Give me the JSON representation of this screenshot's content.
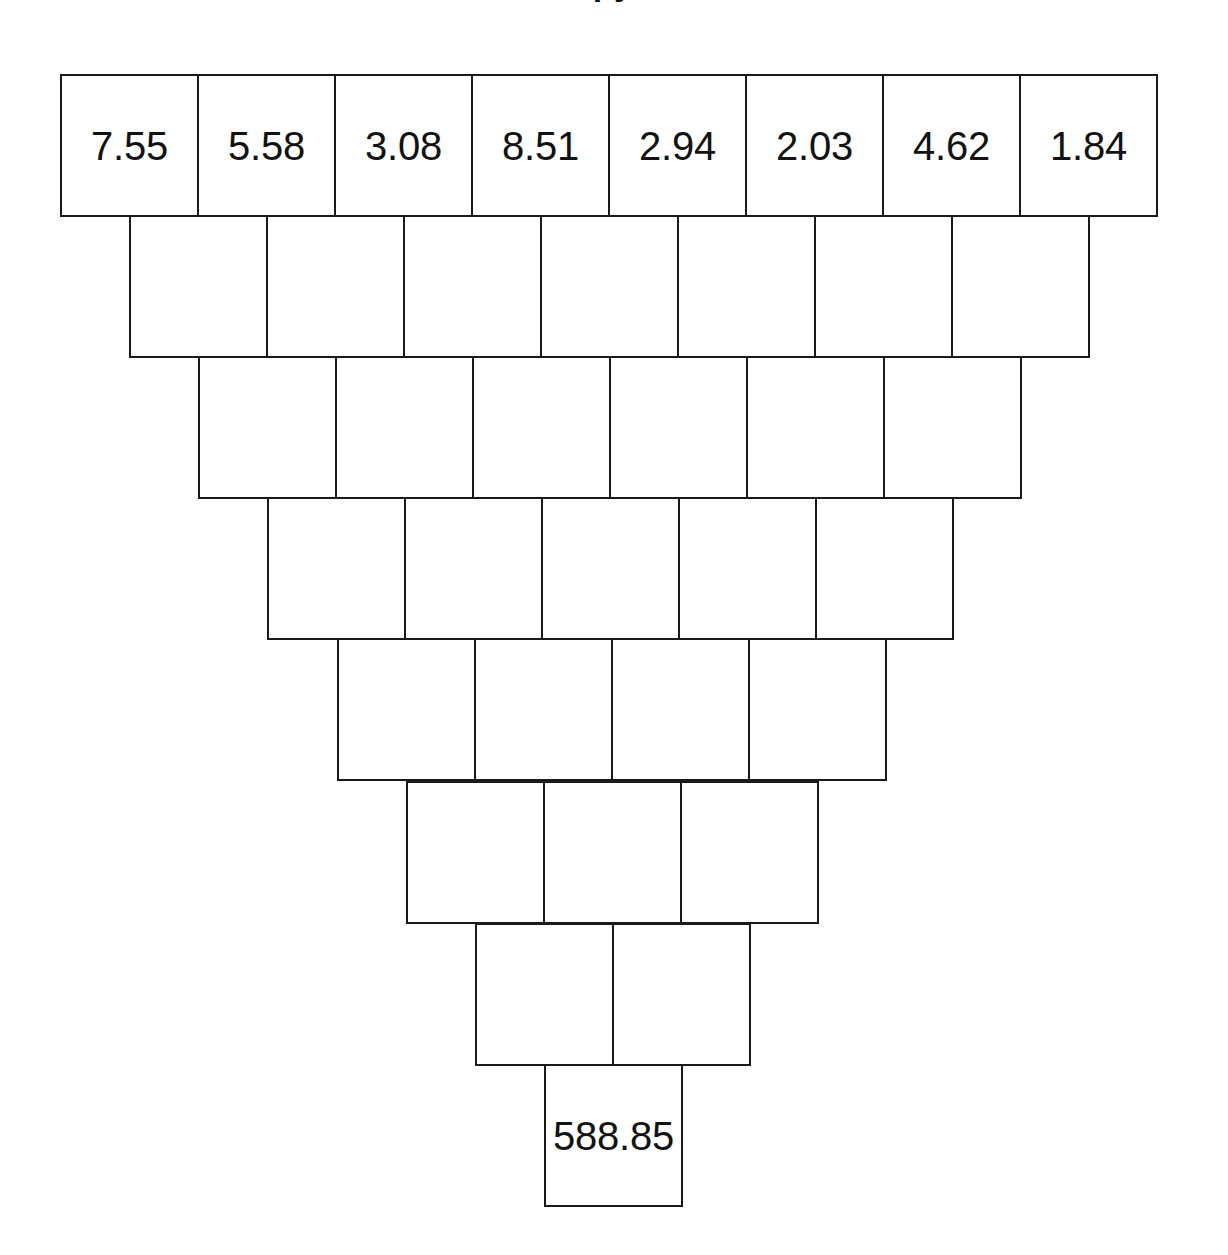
{
  "document": {
    "title_partial": "Zahlenpyramide",
    "title_visible": false
  },
  "canvas": {
    "width": 1228,
    "height": 1255,
    "background_color": "#ffffff",
    "line_color": "#1a1a1a",
    "text_color": "#121212"
  },
  "pyramid": {
    "orientation": "inverted",
    "row_count": 8,
    "cell_width": 137,
    "cell_height": 141,
    "rows": [
      {
        "index": 0,
        "cell_count": 8,
        "left": 60,
        "top": 74,
        "cells": [
          {
            "value": "7.55",
            "filled": true
          },
          {
            "value": "5.58",
            "filled": true
          },
          {
            "value": "3.08",
            "filled": true
          },
          {
            "value": "8.51",
            "filled": true
          },
          {
            "value": "2.94",
            "filled": true
          },
          {
            "value": "2.03",
            "filled": true
          },
          {
            "value": "4.62",
            "filled": true
          },
          {
            "value": "1.84",
            "filled": true
          }
        ]
      },
      {
        "index": 1,
        "cell_count": 7,
        "left": 129,
        "top": 215,
        "cells": [
          {
            "value": "",
            "filled": false
          },
          {
            "value": "",
            "filled": false
          },
          {
            "value": "",
            "filled": false
          },
          {
            "value": "",
            "filled": false
          },
          {
            "value": "",
            "filled": false
          },
          {
            "value": "",
            "filled": false
          },
          {
            "value": "",
            "filled": false
          }
        ]
      },
      {
        "index": 2,
        "cell_count": 6,
        "left": 198,
        "top": 356,
        "cells": [
          {
            "value": "",
            "filled": false
          },
          {
            "value": "",
            "filled": false
          },
          {
            "value": "",
            "filled": false
          },
          {
            "value": "",
            "filled": false
          },
          {
            "value": "",
            "filled": false
          },
          {
            "value": "",
            "filled": false
          }
        ]
      },
      {
        "index": 3,
        "cell_count": 5,
        "left": 267,
        "top": 497,
        "cells": [
          {
            "value": "",
            "filled": false
          },
          {
            "value": "",
            "filled": false
          },
          {
            "value": "",
            "filled": false
          },
          {
            "value": "",
            "filled": false
          },
          {
            "value": "",
            "filled": false
          }
        ]
      },
      {
        "index": 4,
        "cell_count": 4,
        "left": 337,
        "top": 638,
        "cells": [
          {
            "value": "",
            "filled": false
          },
          {
            "value": "",
            "filled": false
          },
          {
            "value": "",
            "filled": false
          },
          {
            "value": "",
            "filled": false
          }
        ]
      },
      {
        "index": 5,
        "cell_count": 3,
        "left": 406,
        "top": 781,
        "cells": [
          {
            "value": "",
            "filled": false
          },
          {
            "value": "",
            "filled": false
          },
          {
            "value": "",
            "filled": false
          }
        ]
      },
      {
        "index": 6,
        "cell_count": 2,
        "left": 475,
        "top": 923,
        "cells": [
          {
            "value": "",
            "filled": false
          },
          {
            "value": "",
            "filled": false
          }
        ]
      },
      {
        "index": 7,
        "cell_count": 1,
        "left": 544,
        "top": 1064,
        "cells": [
          {
            "value": "588.85",
            "filled": true
          }
        ]
      }
    ]
  }
}
